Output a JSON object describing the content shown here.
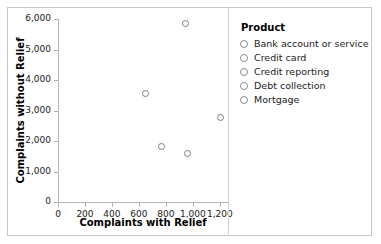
{
  "chart_data": {
    "type": "scatter",
    "title": "",
    "xlabel": "Complaints with Relief",
    "ylabel": "Complaints without Relief",
    "xlim": [
      0,
      1260
    ],
    "ylim": [
      0,
      6000
    ],
    "xticks": [
      0,
      200,
      400,
      600,
      800,
      1000,
      1200
    ],
    "xtick_labels": [
      "0",
      "200",
      "400",
      "600",
      "800",
      "1,000",
      "1,200"
    ],
    "yticks": [
      0,
      1000,
      2000,
      3000,
      4000,
      5000,
      6000
    ],
    "ytick_labels": [
      "0",
      "1,000",
      "2,000",
      "3,000",
      "4,000",
      "5,000",
      "6,000"
    ],
    "grid": false,
    "legend_position": "right",
    "legend_title": "Product",
    "marker": {
      "shape": "circle-open",
      "edge_color": "#7d7d7d",
      "fill_color": "none",
      "size": 7
    },
    "series": [
      {
        "name": "Bank account or service",
        "x": 645,
        "y": 3550
      },
      {
        "name": "Credit card",
        "x": 770,
        "y": 1820
      },
      {
        "name": "Credit reporting",
        "x": 948,
        "y": 5840
      },
      {
        "name": "Debt collection",
        "x": 963,
        "y": 1600
      },
      {
        "name": "Mortgage",
        "x": 1205,
        "y": 2760
      }
    ]
  },
  "legend": {
    "title": "Product",
    "items": [
      {
        "label": "Bank account or service"
      },
      {
        "label": "Credit card"
      },
      {
        "label": "Credit reporting"
      },
      {
        "label": "Debt collection"
      },
      {
        "label": "Mortgage"
      }
    ]
  },
  "colors": {
    "marker_edge": "#7d7d7d",
    "axis_line": "#b4b4b4",
    "frame_border": "#c8c8c8",
    "text": "#1a1a1a",
    "background": "#ffffff"
  }
}
